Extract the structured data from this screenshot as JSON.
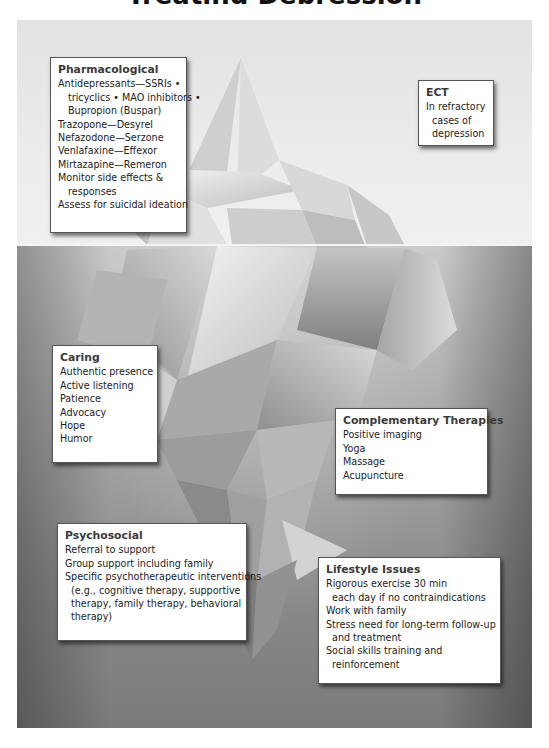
{
  "title": "Treating Depression",
  "colors": {
    "sky": "#e6e6e6",
    "sea_top": "#c8c8c8",
    "sea_bottom": "#7a7a7a",
    "box_background": "#ffffff",
    "box_border": "#555555",
    "heading_text": "#3a3a3a"
  },
  "boxes": {
    "pharmacological": {
      "heading": "Pharmacological",
      "lines": [
        "Antidepressants—SSRIs •",
        "tricyclics • MAO inhibitors •",
        "Bupropion (Buspar)",
        "Trazopone—Desyrel",
        "Nefazodone—Serzone",
        "Venlafaxine—Effexor",
        "Mirtazapine—Remeron",
        "Monitor side effects &",
        "responses",
        "Assess for suicidal ideation"
      ]
    },
    "ect": {
      "heading": "ECT",
      "lines": [
        "In refractory",
        "cases of",
        "depression"
      ]
    },
    "caring": {
      "heading": "Caring",
      "lines": [
        "Authentic presence",
        "Active listening",
        "Patience",
        "Advocacy",
        "Hope",
        "Humor"
      ]
    },
    "complementary": {
      "heading": "Complementary Therapies",
      "lines": [
        "Positive imaging",
        "Yoga",
        "Massage",
        "Acupuncture"
      ]
    },
    "psychosocial": {
      "heading": "Psychosocial",
      "lines": [
        "Referral to support",
        "Group support including family",
        "Specific psychotherapeutic interventions",
        "(e.g., cognitive therapy, supportive",
        "therapy, family therapy, behavioral",
        "therapy)"
      ]
    },
    "lifestyle": {
      "heading": "Lifestyle Issues",
      "lines": [
        "Rigorous exercise 30 min",
        "each day if no contraindications",
        "Work with family",
        "Stress need for long-term follow-up",
        "and treatment",
        "Social skills training and",
        "reinforcement"
      ]
    }
  }
}
